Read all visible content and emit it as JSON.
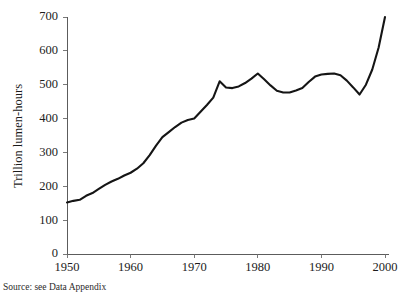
{
  "figure": {
    "cropped_title_fragment": "",
    "source_note": "Source: see Data Appendix"
  },
  "chart_data": {
    "type": "line",
    "title": "",
    "subtitle": "",
    "xlabel": "",
    "ylabel": "Trillion lumen-hours",
    "xlim": [
      1950,
      2000
    ],
    "ylim": [
      0,
      700
    ],
    "grid": false,
    "legend": null,
    "legend_position": "none",
    "x_ticks": [
      1950,
      1960,
      1970,
      1980,
      1990,
      2000
    ],
    "x_tick_labels": [
      "1950",
      "1960",
      "1970",
      "1980",
      "1990",
      "2000"
    ],
    "y_ticks": [
      0,
      100,
      200,
      300,
      400,
      500,
      600,
      700
    ],
    "y_tick_labels": [
      "0",
      "100",
      "200",
      "300",
      "400",
      "500",
      "600",
      "700"
    ],
    "series": [
      {
        "name": "Trillion lumen-hours",
        "color": "#151515",
        "x": [
          1950,
          1951,
          1952,
          1953,
          1954,
          1955,
          1956,
          1957,
          1958,
          1959,
          1960,
          1961,
          1962,
          1963,
          1964,
          1965,
          1966,
          1967,
          1968,
          1969,
          1970,
          1971,
          1972,
          1973,
          1974,
          1975,
          1976,
          1977,
          1978,
          1979,
          1980,
          1981,
          1982,
          1983,
          1984,
          1985,
          1986,
          1987,
          1988,
          1989,
          1990,
          1991,
          1992,
          1993,
          1994,
          1995,
          1996,
          1997,
          1998,
          1999,
          2000
        ],
        "values": [
          152,
          157,
          160,
          172,
          180,
          192,
          204,
          214,
          222,
          232,
          240,
          252,
          268,
          292,
          320,
          345,
          360,
          375,
          388,
          396,
          400,
          420,
          440,
          462,
          510,
          492,
          490,
          495,
          505,
          518,
          533,
          516,
          498,
          482,
          477,
          477,
          483,
          490,
          508,
          524,
          530,
          532,
          533,
          528,
          512,
          492,
          471,
          500,
          545,
          610,
          700
        ]
      }
    ]
  }
}
